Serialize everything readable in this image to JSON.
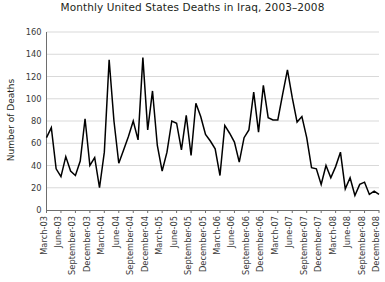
{
  "chart_data": {
    "type": "line",
    "title": "Monthly United States Deaths in Iraq, 2003–2008",
    "xlabel": "",
    "ylabel": "Number of Deaths",
    "ylim": [
      0,
      160
    ],
    "yticks": [
      0,
      20,
      40,
      60,
      80,
      100,
      120,
      140,
      160
    ],
    "grid": true,
    "legend": "none",
    "x": [
      "March-03",
      "April-03",
      "May-03",
      "June-03",
      "July-03",
      "August-03",
      "September-03",
      "October-03",
      "November-03",
      "December-03",
      "January-04",
      "February-04",
      "March-04",
      "April-04",
      "May-04",
      "June-04",
      "July-04",
      "August-04",
      "September-04",
      "October-04",
      "November-04",
      "December-04",
      "January-05",
      "February-05",
      "March-05",
      "April-05",
      "May-05",
      "June-05",
      "July-05",
      "August-05",
      "September-05",
      "October-05",
      "November-05",
      "December-05",
      "January-06",
      "February-06",
      "March-06",
      "April-06",
      "May-06",
      "June-06",
      "July-06",
      "August-06",
      "September-06",
      "October-06",
      "November-06",
      "December-06",
      "January-07",
      "February-07",
      "March-07",
      "April-07",
      "May-07",
      "June-07",
      "July-07",
      "August-07",
      "September-07",
      "October-07",
      "November-07",
      "December-07",
      "January-08",
      "February-08",
      "March-08",
      "April-08",
      "May-08",
      "June-08",
      "July-08",
      "August-08",
      "September-08",
      "October-08",
      "November-08",
      "December-08"
    ],
    "xtick_labels": [
      "March-03",
      "June-03",
      "September-03",
      "December-03",
      "March-04",
      "June-04",
      "September-04",
      "December-04",
      "March-05",
      "June-05",
      "September-05",
      "December-05",
      "March-06",
      "June-06",
      "September-06",
      "December-06",
      "March-07",
      "June-07",
      "September-07",
      "December-07",
      "March-08",
      "June-08",
      "September-08",
      "December-08"
    ],
    "xtick_indices": [
      0,
      3,
      6,
      9,
      12,
      15,
      18,
      21,
      24,
      27,
      30,
      33,
      36,
      39,
      42,
      45,
      48,
      51,
      54,
      57,
      60,
      63,
      66,
      69
    ],
    "values": [
      65,
      74,
      37,
      30,
      48,
      35,
      31,
      44,
      82,
      40,
      47,
      20,
      52,
      135,
      80,
      42,
      54,
      66,
      80,
      63,
      137,
      72,
      107,
      58,
      35,
      52,
      80,
      78,
      54,
      85,
      49,
      96,
      84,
      68,
      62,
      55,
      31,
      76,
      69,
      61,
      43,
      65,
      72,
      106,
      70,
      112,
      83,
      81,
      81,
      104,
      126,
      101,
      79,
      84,
      65,
      38,
      37,
      23,
      40,
      29,
      39,
      52,
      19,
      29,
      13,
      23,
      25,
      14,
      17,
      14
    ]
  }
}
